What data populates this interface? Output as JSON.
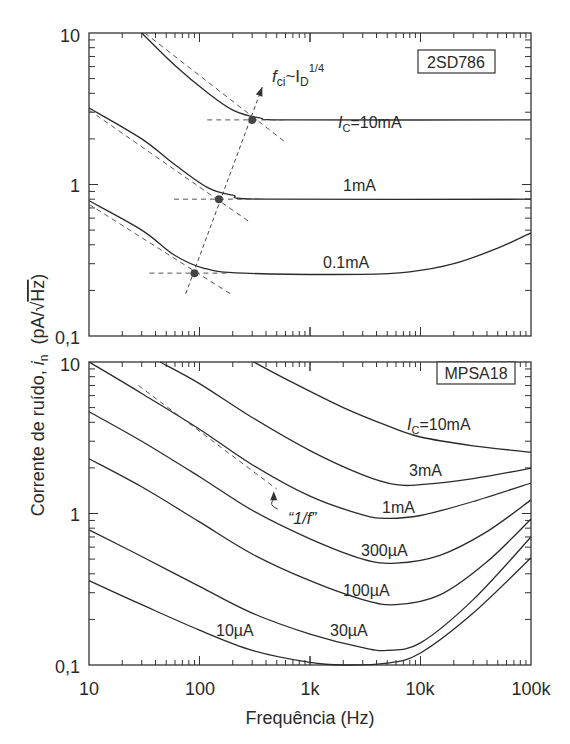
{
  "chart_data": [
    {
      "type": "line",
      "panel": "top",
      "device_label": "2SD786",
      "xscale": "log",
      "yscale": "log",
      "xlim": [
        10,
        100000
      ],
      "ylim": [
        0.1,
        10
      ],
      "y_ticks": [
        "10",
        "1",
        "0,1"
      ],
      "annotation": {
        "text_f": "f",
        "text_sub": "ci",
        "text_mid": "~I",
        "text_sub2": "D",
        "text_sup": "1/4"
      },
      "series": [
        {
          "name": "IC=10mA",
          "label_prefix": "I",
          "label_sub": "C",
          "label_rest": "=10mA",
          "points": [
            [
              30,
              10
            ],
            [
              60,
              6.1
            ],
            [
              120,
              4.0
            ],
            [
              200,
              3.1
            ],
            [
              350,
              2.75
            ],
            [
              700,
              2.67
            ],
            [
              100000,
              2.67
            ]
          ],
          "corner": [
            300,
            2.67
          ],
          "asym": [
            [
              32,
              10
            ],
            [
              600,
              1.9
            ]
          ]
        },
        {
          "name": "1mA",
          "label": "1mA",
          "points": [
            [
              10,
              3.2
            ],
            [
              30,
              2.0
            ],
            [
              60,
              1.35
            ],
            [
              120,
              0.95
            ],
            [
              200,
              0.85
            ],
            [
              400,
              0.8
            ],
            [
              100000,
              0.8
            ]
          ],
          "corner": [
            150,
            0.8
          ],
          "asym": [
            [
              10,
              3.1
            ],
            [
              280,
              0.57
            ]
          ]
        },
        {
          "name": "0.1mA",
          "label": "0.1mA",
          "points": [
            [
              10,
              0.78
            ],
            [
              30,
              0.5
            ],
            [
              60,
              0.34
            ],
            [
              110,
              0.28
            ],
            [
              250,
              0.26
            ],
            [
              3000,
              0.255
            ],
            [
              8000,
              0.265
            ],
            [
              20000,
              0.3
            ],
            [
              50000,
              0.38
            ],
            [
              100000,
              0.48
            ]
          ],
          "corner": [
            90,
            0.26
          ],
          "asym": [
            [
              10,
              0.74
            ],
            [
              190,
              0.19
            ]
          ]
        }
      ],
      "trend_arrow": {
        "from": [
          75,
          0.19
        ],
        "to": [
          370,
          4.4
        ]
      }
    },
    {
      "type": "line",
      "panel": "bottom",
      "device_label": "MPSA18",
      "xscale": "log",
      "yscale": "log",
      "xlim": [
        10,
        100000
      ],
      "ylim": [
        0.1,
        10
      ],
      "x_ticks": [
        "10",
        "100",
        "1k",
        "10k",
        "100k"
      ],
      "y_ticks": [
        "10",
        "1",
        "0,1"
      ],
      "xlabel": "Frequência (Hz)",
      "series": [
        {
          "name": "IC=10mA",
          "label_prefix": "I",
          "label_sub": "C",
          "label_rest": "=10mA",
          "points": [
            [
              310,
              10
            ],
            [
              700,
              7.3
            ],
            [
              2000,
              5.0
            ],
            [
              5000,
              3.8
            ],
            [
              10000,
              3.2
            ],
            [
              30000,
              2.8
            ],
            [
              100000,
              2.54
            ]
          ]
        },
        {
          "name": "3mA",
          "label": "3mA",
          "points": [
            [
              44,
              10
            ],
            [
              100,
              7.2
            ],
            [
              300,
              4.3
            ],
            [
              1000,
              2.6
            ],
            [
              3000,
              1.8
            ],
            [
              6000,
              1.55
            ],
            [
              10000,
              1.55
            ],
            [
              30000,
              1.7
            ],
            [
              100000,
              1.99
            ]
          ]
        },
        {
          "name": "1mA",
          "label": "1mA",
          "points": [
            [
              10,
              10
            ],
            [
              30,
              6.2
            ],
            [
              100,
              3.6
            ],
            [
              300,
              2.1
            ],
            [
              1000,
              1.3
            ],
            [
              3000,
              0.98
            ],
            [
              5000,
              0.93
            ],
            [
              10000,
              0.97
            ],
            [
              30000,
              1.2
            ],
            [
              100000,
              1.59
            ]
          ]
        },
        {
          "name": "300µA",
          "label": "300µA",
          "points": [
            [
              10,
              4.7
            ],
            [
              30,
              3.0
            ],
            [
              100,
              1.75
            ],
            [
              300,
              1.05
            ],
            [
              1000,
              0.68
            ],
            [
              3000,
              0.5
            ],
            [
              6000,
              0.47
            ],
            [
              15000,
              0.53
            ],
            [
              40000,
              0.76
            ],
            [
              100000,
              1.23
            ]
          ]
        },
        {
          "name": "100µA",
          "label": "100µA",
          "points": [
            [
              10,
              2.3
            ],
            [
              30,
              1.5
            ],
            [
              100,
              0.88
            ],
            [
              300,
              0.54
            ],
            [
              1000,
              0.36
            ],
            [
              3000,
              0.27
            ],
            [
              6000,
              0.25
            ],
            [
              15000,
              0.29
            ],
            [
              40000,
              0.48
            ],
            [
              100000,
              0.92
            ]
          ]
        },
        {
          "name": "30µA",
          "label": "30µA",
          "points": [
            [
              10,
              0.78
            ],
            [
              30,
              0.52
            ],
            [
              100,
              0.33
            ],
            [
              300,
              0.22
            ],
            [
              1000,
              0.16
            ],
            [
              3000,
              0.13
            ],
            [
              5000,
              0.125
            ],
            [
              10000,
              0.14
            ],
            [
              30000,
              0.27
            ],
            [
              100000,
              0.7
            ]
          ]
        },
        {
          "name": "10µA",
          "label": "10µA",
          "points": [
            [
              10,
              0.36
            ],
            [
              30,
              0.25
            ],
            [
              100,
              0.17
            ],
            [
              300,
              0.125
            ],
            [
              1000,
              0.104
            ],
            [
              2000,
              0.1
            ],
            [
              5000,
              0.103
            ],
            [
              10000,
              0.12
            ],
            [
              30000,
              0.22
            ],
            [
              100000,
              0.51
            ]
          ]
        }
      ],
      "one_over_f": {
        "label": "“1/f”",
        "line": [
          [
            28,
            7.0
          ],
          [
            500,
            1.45
          ]
        ],
        "arrow_tip": [
          470,
          1.4
        ],
        "arrow_tail": [
          510,
          1.07
        ]
      }
    }
  ],
  "ylabel": {
    "main": "Corrente de ruído, ",
    "symbol": "i",
    "sub": "n",
    "unit_open": "  (pA/",
    "sqrt": "√",
    "unit_inner": "Hz",
    "unit_close": ")"
  },
  "colors": {
    "line": "#2a2a2a",
    "dash": "#555555",
    "dot": "#444444"
  }
}
